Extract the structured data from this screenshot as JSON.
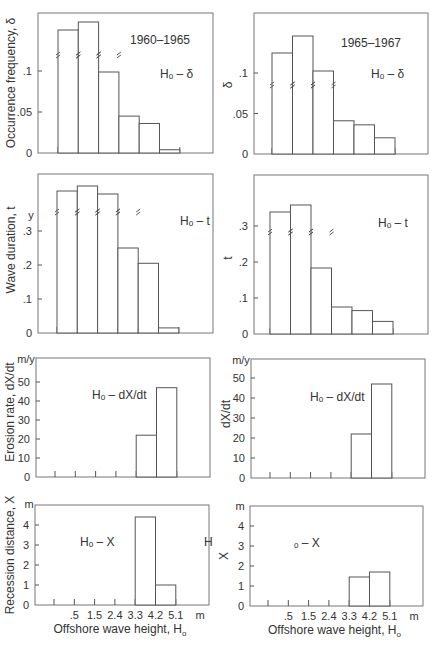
{
  "figure": {
    "x_axis_title": "Offshore wave height, H",
    "x_axis_subscript": "o",
    "x_unit": "m",
    "x_tick_labels": [
      ".5",
      "1.5",
      "2.4",
      "3.3",
      "4.2",
      "5.1"
    ]
  },
  "chart_data": [
    {
      "id": "left-frequency",
      "type": "bar",
      "title": "1960–1965",
      "annotation": "Hₒ – δ",
      "ylabel": "Occurrence frequency, δ",
      "y_unit": "",
      "categories": [
        ".5",
        "1.5",
        "2.4",
        "3.3",
        "4.2",
        "5.1"
      ],
      "values": [
        0.18,
        0.19,
        0.097,
        0.045,
        0.036,
        0.004
      ],
      "broken_bars": [
        0,
        1,
        2
      ],
      "y_ticks": [
        "0",
        ".05",
        ".1"
      ],
      "ylim": [
        0,
        0.125
      ]
    },
    {
      "id": "right-frequency",
      "type": "bar",
      "title": "1965–1967",
      "annotation": "Hₒ – δ",
      "ylabel": "δ",
      "y_unit": "",
      "categories": [
        ".5",
        "1.5",
        "2.4",
        "3.3",
        "4.2",
        "5.1"
      ],
      "values": [
        0.15,
        0.17,
        0.101,
        0.041,
        0.036,
        0.02
      ],
      "broken_bars": [
        0,
        1,
        2
      ],
      "y_ticks": [
        "0",
        ".05",
        ".1"
      ],
      "ylim": [
        0,
        0.125
      ]
    },
    {
      "id": "left-duration",
      "type": "bar",
      "title": "",
      "annotation": "Hₒ – t",
      "ylabel": "Wave duration, t",
      "y_unit": "y",
      "categories": [
        ".5",
        "1.5",
        "2.4",
        "3.3",
        "4.2",
        "5.1"
      ],
      "values": [
        0.45,
        0.46,
        0.44,
        0.25,
        0.205,
        0.015
      ],
      "broken_bars": [
        0,
        1,
        2,
        3
      ],
      "y_ticks": [
        "0",
        ".1",
        ".2",
        ".3"
      ],
      "ylim": [
        0,
        0.37
      ]
    },
    {
      "id": "right-duration",
      "type": "bar",
      "title": "",
      "annotation": "Hₒ – t",
      "ylabel": "t",
      "y_unit": "",
      "categories": [
        ".5",
        "1.5",
        "2.4",
        "3.3",
        "4.2",
        "5.1"
      ],
      "values": [
        0.34,
        0.36,
        0.185,
        0.075,
        0.065,
        0.035
      ],
      "broken_bars": [
        0,
        1,
        2
      ],
      "y_ticks": [
        "0",
        ".1",
        ".2",
        ".3"
      ],
      "ylim": [
        0,
        0.37
      ]
    },
    {
      "id": "left-erosion",
      "type": "bar",
      "title": "",
      "annotation": "Hₒ – dX/dt",
      "ylabel": "Erosion rate, dX/dt",
      "y_unit": "m/y",
      "categories": [
        ".5",
        "1.5",
        "2.4",
        "3.3",
        "4.2",
        "5.1"
      ],
      "values": [
        0,
        0,
        0,
        0,
        22,
        47
      ],
      "broken_bars": [],
      "y_ticks": [
        "0",
        "10",
        "20",
        "30",
        "40",
        "50"
      ],
      "ylim": [
        0,
        55
      ]
    },
    {
      "id": "right-erosion",
      "type": "bar",
      "title": "",
      "annotation": "Hₒ – dX/dt",
      "ylabel": "dX/dt",
      "y_unit": "m/y",
      "categories": [
        ".5",
        "1.5",
        "2.4",
        "3.3",
        "4.2",
        "5.1"
      ],
      "values": [
        0,
        0,
        0,
        0,
        22,
        47
      ],
      "broken_bars": [],
      "y_ticks": [
        "0",
        "10",
        "20",
        "30",
        "40",
        "50"
      ],
      "ylim": [
        0,
        55
      ]
    },
    {
      "id": "left-recession",
      "type": "bar",
      "title": "",
      "annotation": "Hₒ – X",
      "extra_label": "H",
      "ylabel": "Recession distance, X",
      "y_unit": "m",
      "categories": [
        ".5",
        "1.5",
        "2.4",
        "3.3",
        "4.2",
        "5.1"
      ],
      "values": [
        0,
        0,
        0,
        0,
        4.4,
        1.0
      ],
      "broken_bars": [],
      "y_ticks": [
        "0",
        "1",
        "2",
        "3",
        "4"
      ],
      "ylim": [
        0,
        5
      ]
    },
    {
      "id": "right-recession",
      "type": "bar",
      "title": "",
      "annotation": "ₒ – X",
      "ylabel": "X",
      "y_unit": "m",
      "categories": [
        ".5",
        "1.5",
        "2.4",
        "3.3",
        "4.2",
        "5.1"
      ],
      "values": [
        0,
        0,
        0,
        0,
        1.45,
        1.7
      ],
      "broken_bars": [],
      "y_ticks": [
        "0",
        "1",
        "2",
        "3",
        "4"
      ],
      "ylim": [
        0,
        5
      ]
    }
  ]
}
